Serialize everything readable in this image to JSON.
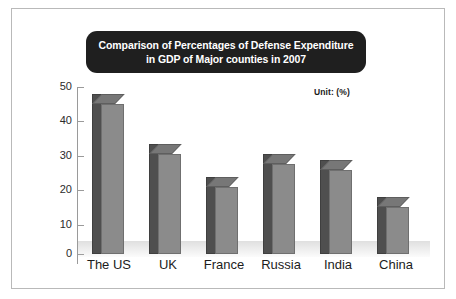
{
  "figure": {
    "title_lines": [
      "Comparison of Percentages of Defense Expenditure",
      "in GDP of Major counties in 2007"
    ],
    "unit_note": "Unit: (%)",
    "colors": {
      "title_background": "#1f1f1f",
      "title_text": "#ffffff",
      "bar_front": "#8b8b8b",
      "bar_side": "#4f4f4f",
      "bar_top": "#777777",
      "axis": "#9a9a9a",
      "frame": "#b9b9b9",
      "page_background": "#ffffff"
    }
  },
  "chart_data": {
    "type": "bar",
    "title": "Comparison of Percentages of Defense Expenditure in GDP of Major counties in 2007",
    "xlabel": "",
    "ylabel": "",
    "unit": "(%)",
    "categories": [
      "The US",
      "UK",
      "France",
      "Russia",
      "India",
      "China"
    ],
    "values": [
      45,
      30,
      20,
      27,
      25,
      14
    ],
    "ylim": [
      0,
      50
    ],
    "yticks": [
      0,
      10,
      20,
      30,
      40,
      50
    ],
    "ytick_labels": [
      "0",
      "10",
      "20",
      "30",
      "40",
      "50"
    ],
    "grid": false,
    "legend": false,
    "annotations": [
      "Unit: (%)"
    ],
    "style": "3d-column"
  }
}
